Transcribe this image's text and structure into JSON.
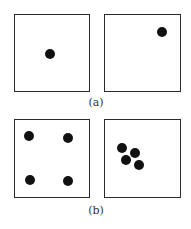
{
  "panels": [
    {
      "label": "(a)",
      "boxes": [
        {
          "dots": [
            [
              50,
              54
            ]
          ]
        },
        {
          "dots": [
            [
              162,
              32
            ]
          ]
        }
      ]
    },
    {
      "label": "(b)",
      "boxes": [
        {
          "dots": [
            [
              29,
              136
            ],
            [
              68,
              138
            ],
            [
              30,
              180
            ],
            [
              68,
              181
            ]
          ]
        },
        {
          "dots": [
            [
              122,
              148
            ],
            [
              135,
              153
            ],
            [
              126,
              160
            ],
            [
              139,
              165
            ]
          ]
        }
      ]
    }
  ],
  "colors": {
    "dot": "#111111",
    "border": "#2b2b2b"
  }
}
